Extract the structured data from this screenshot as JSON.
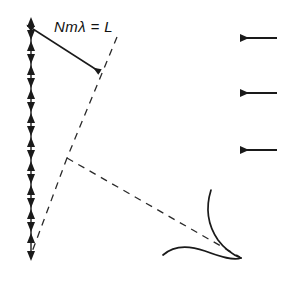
{
  "figure": {
    "title": "",
    "background_color": "#ffffff",
    "stroke_color": "#1a1a1a",
    "width": 298,
    "height": 284
  },
  "annotations": {
    "length_label": "Nmλ = L"
  },
  "elements": {
    "vortex_sheet": {
      "name": "vertical-double-arrow-line",
      "x": 31,
      "y_top": 20,
      "y_bottom": 258,
      "arrow_pair_count": 11,
      "description": "vertical line with alternating up and down arrowheads"
    },
    "measure_arrow": {
      "name": "length-measure-double-arrow",
      "x1": 31,
      "y1": 28,
      "x2": 102,
      "y2": 74,
      "heads": "both"
    },
    "dashed_upper": {
      "name": "dashed-line-upper",
      "x1": 117,
      "y1": 37,
      "x2": 67,
      "y2": 158
    },
    "dashed_lower_left": {
      "name": "dashed-line-lower-left",
      "x1": 67,
      "y1": 158,
      "x2": 31,
      "y2": 251
    },
    "dashed_to_airfoil": {
      "name": "dashed-line-to-airfoil",
      "x1": 67,
      "y1": 158,
      "x2": 239,
      "y2": 257
    },
    "airfoil": {
      "name": "airfoil-cross-section",
      "trailing_edge_x": 241,
      "trailing_edge_y": 258
    },
    "flow_arrows": [
      {
        "name": "flow-arrow-1",
        "x_tail": 277,
        "x_head": 233,
        "y": 38,
        "direction": "left"
      },
      {
        "name": "flow-arrow-2",
        "x_tail": 277,
        "x_head": 233,
        "y": 93,
        "direction": "left"
      },
      {
        "name": "flow-arrow-3",
        "x_tail": 277,
        "x_head": 233,
        "y": 150,
        "direction": "left"
      }
    ]
  }
}
